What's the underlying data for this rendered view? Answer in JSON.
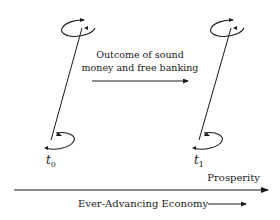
{
  "diagram": {
    "nodes": [
      {
        "id": "t0",
        "label_base": "t",
        "label_sub": "0",
        "x": 52
      },
      {
        "id": "t1",
        "label_base": "t",
        "label_sub": "1",
        "x": 200
      }
    ],
    "middle_arrow": {
      "line1": "Outcome of sound",
      "line2": "money and free banking"
    },
    "axis": {
      "label": "Prosperity",
      "caption": "Ever-Advancing Economy"
    },
    "colors": {
      "ink": "#1a1a1a",
      "background": "#ffffff"
    }
  }
}
